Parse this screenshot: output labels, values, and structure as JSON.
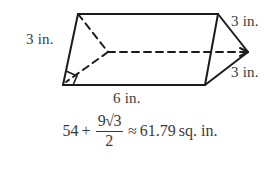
{
  "figure": {
    "type": "geometry-diagram",
    "shape_name": "triangular-prism",
    "colors": {
      "background": "#ffffff",
      "stroke": "#1c1c1c",
      "text": "#3a3a3a"
    },
    "labels": {
      "left_edge": "3 in.",
      "right_top_edge": "3 in.",
      "right_bottom_edge": "3 in.",
      "bottom_edge": "6 in."
    },
    "answer": {
      "leading_term": "54",
      "plus_sign": "+",
      "fraction_numerator": "9√3",
      "fraction_denominator": "2",
      "approx_sign": "≈",
      "approx_value": "61.79",
      "units": "sq. in.",
      "full_text": "54 + 9√3/2 ≈ 61.79 sq. in."
    }
  }
}
